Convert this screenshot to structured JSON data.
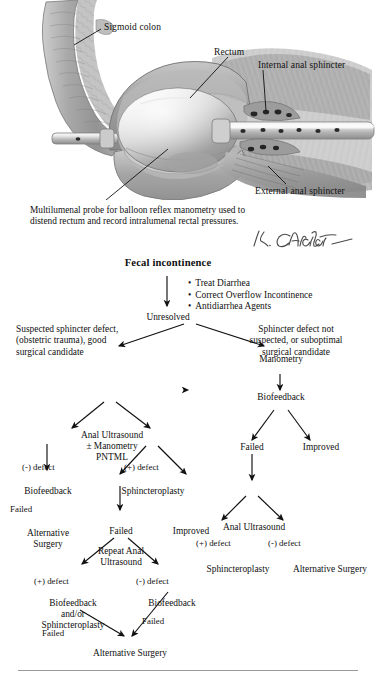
{
  "illustration": {
    "alt_name": "balloon-reflex-manometry-anatomy",
    "labels": {
      "sigmoid_colon": "Sigmoid colon",
      "rectum": "Rectum",
      "internal_anal_sphincter": "Internal anal sphincter",
      "external_anal_sphincter": "External anal sphincter"
    },
    "caption": "Multilumenal probe for balloon reflex manometry used to distend rectum and record intralumenal rectal pressures.",
    "signature": "K. Carter"
  },
  "flowchart": {
    "title": "Fecal incontinence",
    "initial_measures": [
      "Treat Diarrhea",
      "Correct Overflow Incontinence",
      "Antidiarrhea Agents"
    ],
    "nodes": {
      "unresolved": "Unresolved",
      "left_criteria": "Suspected sphincter defect,\n(obstetric trauma), good\nsurgical candidate",
      "right_criteria": "Sphincter defect not\nsuspected, or suboptimal\nsurgical candidate",
      "anal_ultrasound_pntml": "Anal Ultrasound\n± Manometry\nPNTML",
      "manometry": "Manometry",
      "biofeedback_left": "Biofeedback",
      "sphincteroplasty_left": "Sphincteroplasty",
      "biofeedback_right": "Biofeedback",
      "alternative_surgery_left": "Alternative\nSurgery",
      "failed_mid": "Failed",
      "improved_mid": "Improved",
      "failed_right": "Failed",
      "improved_right": "Improved",
      "repeat_anal_ultrasound": "Repeat Anal\nUltrasound",
      "anal_ultrasound_right": "Anal Ultrasound",
      "sphincteroplasty_right": "Sphincteroplasty",
      "alternative_surgery_right": "Alternative Surgery",
      "biofeedback_sphincteroplasty": "Biofeedback\nand/or\nSphincteroplasty",
      "biofeedback_bottom": "Biofeedback",
      "alternative_surgery_bottom": "Alternative Surgery"
    },
    "edge_labels": {
      "neg_defect_1": "(-) defect",
      "pos_defect_1": "(+) defect",
      "failed_bf_left": "Failed",
      "pos_defect_2": "(+) defect",
      "neg_defect_2": "(-) defect",
      "pos_defect_3": "(+) defect",
      "neg_defect_3": "(-) defect",
      "failed_bottom_left": "Failed",
      "failed_bottom_right": "Failed"
    }
  },
  "colors": {
    "text": "#111111",
    "rule": "#9a9a9a",
    "background": "#ffffff"
  }
}
